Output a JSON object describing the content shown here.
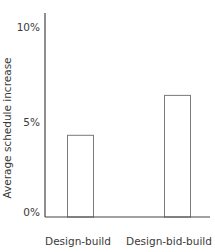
{
  "chart_data": {
    "type": "bar",
    "title": "",
    "xlabel": "",
    "ylabel": "Average schedule increase",
    "categories": [
      "Design-build",
      "Design-bid-build"
    ],
    "values": [
      4.3,
      6.4
    ],
    "unit": "%",
    "ylim": [
      0,
      10
    ],
    "yticks": [
      {
        "value": 0,
        "label": "0%"
      },
      {
        "value": 5,
        "label": "5%"
      },
      {
        "value": 10,
        "label": "10%"
      }
    ],
    "grid": false,
    "legend": null,
    "bar_style": {
      "fill": "#ffffff",
      "stroke": "#7a7a7a"
    },
    "axis_color": "#444444"
  }
}
